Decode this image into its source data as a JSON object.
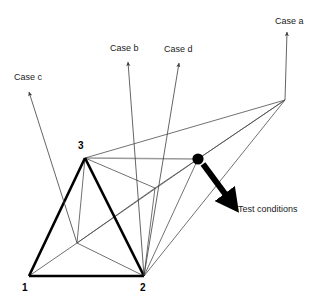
{
  "figure": {
    "background_color": "#ffffff",
    "colors": {
      "thick_edge": "#000000",
      "thin_edge": "#4d4d4d",
      "faint_edge": "#9a9a9a",
      "arrow_thin": "#4d4d4d",
      "arrow_thick": "#000000",
      "text": "#1a1a1a",
      "vertex_label": "#000000",
      "marker_fill": "#000000"
    }
  },
  "vertex_labels": [
    {
      "name": "vertex-1",
      "text": "1",
      "x": 22,
      "y": 291
    },
    {
      "name": "vertex-2",
      "text": "2",
      "x": 140,
      "y": 291
    },
    {
      "name": "vertex-3",
      "text": "3",
      "x": 78,
      "y": 149
    }
  ],
  "case_labels": [
    {
      "name": "case-c",
      "text": "Case c",
      "x": 14,
      "y": 80,
      "anchor": "start"
    },
    {
      "name": "case-b",
      "text": "Case b",
      "x": 110,
      "y": 51,
      "anchor": "start"
    },
    {
      "name": "case-d",
      "text": "Case d",
      "x": 164,
      "y": 52,
      "anchor": "start"
    },
    {
      "name": "case-a",
      "text": "Case a",
      "x": 275,
      "y": 24,
      "anchor": "start"
    }
  ],
  "annotations": [
    {
      "name": "test-conditions",
      "text": "Test conditions",
      "x": 238,
      "y": 212,
      "anchor": "start"
    }
  ],
  "geometry": {
    "points": {
      "v1": [
        29,
        276
      ],
      "v2": [
        144,
        276
      ],
      "v3": [
        85,
        158
      ],
      "v4": [
        77,
        243
      ],
      "apex_right": [
        285,
        100
      ],
      "dot": [
        198,
        159
      ],
      "node_mid": [
        155,
        188
      ]
    },
    "thick_edges": [
      {
        "from": "v1",
        "to": "v2"
      },
      {
        "from": "v1",
        "to": "v3"
      },
      {
        "from": "v3",
        "to": "v2"
      }
    ],
    "thin_edges": [
      {
        "from": "v1",
        "to": "v4"
      },
      {
        "from": "v2",
        "to": "v4"
      },
      {
        "from": "v3",
        "to": "v4"
      },
      {
        "from": "v3",
        "to": "apex_right"
      },
      {
        "from": "v2",
        "to": "apex_right"
      },
      {
        "from": "v3",
        "to": "node_mid"
      },
      {
        "from": "v2",
        "to": "node_mid"
      },
      {
        "from": "v4",
        "to": "node_mid"
      },
      {
        "from": "node_mid",
        "to": "apex_right"
      },
      {
        "from": "dot",
        "to": "apex_right"
      },
      {
        "from": "dot",
        "to": "v2"
      },
      {
        "from": "v4",
        "to": "dot"
      }
    ],
    "faint_edges": [
      {
        "from": "v3",
        "to": "dot"
      }
    ]
  },
  "arrows": {
    "thin": [
      {
        "name": "case-c-arrow",
        "from": [
          77,
          243
        ],
        "to": [
          29,
          92
        ]
      },
      {
        "name": "case-b-arrow",
        "from": [
          144,
          276
        ],
        "to": [
          128,
          62
        ]
      },
      {
        "name": "case-d-arrow",
        "from": [
          144,
          276
        ],
        "to": [
          179,
          63
        ]
      },
      {
        "name": "case-a-arrow",
        "from": [
          285,
          100
        ],
        "to": [
          287,
          32
        ]
      }
    ],
    "thick": [
      {
        "name": "test-conditions-arrow",
        "from": [
          203,
          164
        ],
        "to": [
          234,
          206
        ],
        "width": 6
      }
    ]
  }
}
